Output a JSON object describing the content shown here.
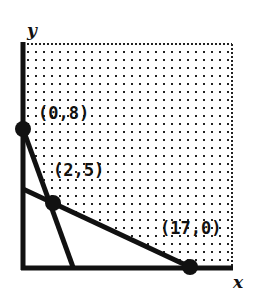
{
  "diagram": {
    "type": "feasible-region-graph",
    "axes": {
      "x_label": "x",
      "y_label": "y"
    },
    "points": [
      {
        "id": "p1",
        "label": "(0,8)",
        "x": 0,
        "y": 8
      },
      {
        "id": "p2",
        "label": "(2,5)",
        "x": 2,
        "y": 5
      },
      {
        "id": "p3",
        "label": "(17,0)",
        "x": 17,
        "y": 0
      }
    ],
    "lines": [
      {
        "id": "steep",
        "from": "(0,8)",
        "through": "(2,5)"
      },
      {
        "id": "shallow",
        "from": "(17,0)",
        "through": "(2,5)"
      }
    ],
    "shaded_region": "dotted area above both lines (unbounded feasible region)",
    "colors": {
      "ink": "#111111",
      "background": "#ffffff"
    }
  }
}
